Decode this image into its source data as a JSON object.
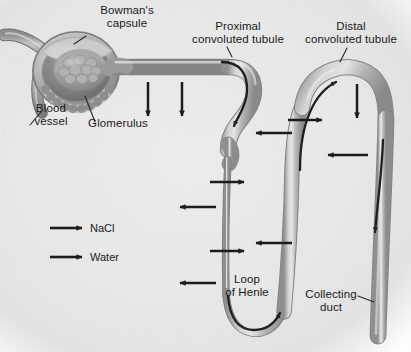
{
  "figure": {
    "background_color": "#e9e9e9",
    "tubule_color": "#a8a8a8",
    "tubule_highlight": "#e4e4e4",
    "arrow_color": "#1c1c1c",
    "text_color": "#1a1a1a"
  },
  "labels": {
    "bowmans_capsule": "Bowman's\ncapsule",
    "glomerulus": "Glomerulus",
    "blood_vessel": "Blood\nvessel",
    "proximal_convoluted_tubule": "Proximal\nconvoluted tubule",
    "distal_convoluted_tubule": "Distal\nconvoluted tubule",
    "loop_of_henle": "Loop\nof Henle",
    "collecting_duct": "Collecting\nduct"
  },
  "legend": {
    "items": [
      {
        "label": "NaCl",
        "arrow": "right-arrow-icon"
      },
      {
        "label": "Water",
        "arrow": "right-arrow-icon"
      }
    ]
  },
  "transport_arrows": [
    {
      "name": "water-out-proximal-1",
      "direction": "down",
      "x": 148,
      "y": 82,
      "length": 38
    },
    {
      "name": "water-out-proximal-2",
      "direction": "down",
      "x": 182,
      "y": 82,
      "length": 38
    },
    {
      "name": "nacl-out-descending-1",
      "direction": "right",
      "x": 210,
      "y": 182,
      "length": 38
    },
    {
      "name": "water-out-descending-1",
      "direction": "left",
      "x": 176,
      "y": 207,
      "length": 40
    },
    {
      "name": "nacl-out-descending-2",
      "direction": "right",
      "x": 210,
      "y": 251,
      "length": 38
    },
    {
      "name": "water-out-descending-2",
      "direction": "left",
      "x": 176,
      "y": 283,
      "length": 40
    },
    {
      "name": "nacl-in-ascending-1",
      "direction": "left",
      "x": 252,
      "y": 133,
      "length": 40
    },
    {
      "name": "nacl-in-ascending-2",
      "direction": "left",
      "x": 252,
      "y": 243,
      "length": 40
    },
    {
      "name": "nacl-out-distal-1",
      "direction": "right",
      "x": 288,
      "y": 120,
      "length": 38
    },
    {
      "name": "water-out-collecting-1",
      "direction": "down",
      "x": 357,
      "y": 84,
      "length": 38
    },
    {
      "name": "water-in-collecting-1",
      "direction": "left",
      "x": 326,
      "y": 155,
      "length": 42
    }
  ],
  "flow_arrows": [
    {
      "name": "flow-proximal-descending",
      "description": "filtrate flow down proximal tubule into descending limb"
    },
    {
      "name": "flow-loop-bottom",
      "description": "filtrate flow around loop of Henle bend"
    },
    {
      "name": "flow-ascending-distal",
      "description": "filtrate flow up ascending limb into distal tubule"
    },
    {
      "name": "flow-collecting-duct",
      "description": "filtrate flow down collecting duct"
    }
  ]
}
